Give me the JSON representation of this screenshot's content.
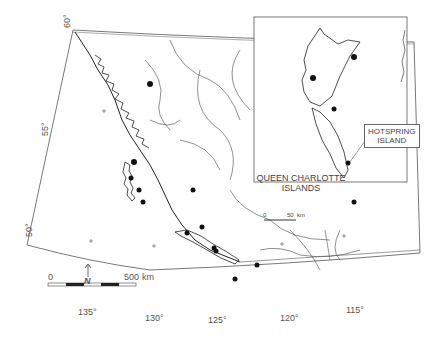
{
  "map": {
    "latitude_labels": [
      "60°",
      "55°",
      "50°"
    ],
    "longitude_labels": [
      "135°",
      "130°",
      "125°",
      "120°",
      "115°"
    ],
    "scale_bar": {
      "start": "0",
      "end": "500",
      "unit": "km"
    },
    "north_arrow": "N"
  },
  "inset": {
    "title_line1": "QUEEN CHARLOTTE",
    "title_line2": "ISLANDS",
    "scale_bar": {
      "start": "0",
      "end": "50",
      "unit": "km"
    },
    "callout_line1": "HOTSPRING",
    "callout_line2": "ISLAND"
  }
}
